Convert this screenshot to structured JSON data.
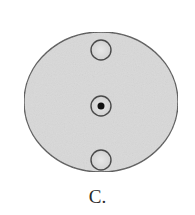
{
  "figure": {
    "label": "C.",
    "colors": {
      "disc_fill": "#d9d9d9",
      "disc_stroke": "#555555",
      "small_circle_fill": "#dedede",
      "small_circle_stroke": "#4a4a4a",
      "dot": "#111111",
      "background": "#ffffff"
    },
    "disc": {
      "cx": 101,
      "cy": 102,
      "rx": 77,
      "ry": 70
    },
    "circles": [
      {
        "name": "top-circle",
        "cx": 101,
        "cy": 50,
        "r": 10,
        "has_dot": false
      },
      {
        "name": "center-circle",
        "cx": 101,
        "cy": 106,
        "r": 10,
        "has_dot": true,
        "dot_r": 3.5
      },
      {
        "name": "bottom-circle",
        "cx": 101,
        "cy": 160,
        "r": 10,
        "has_dot": false
      }
    ]
  }
}
